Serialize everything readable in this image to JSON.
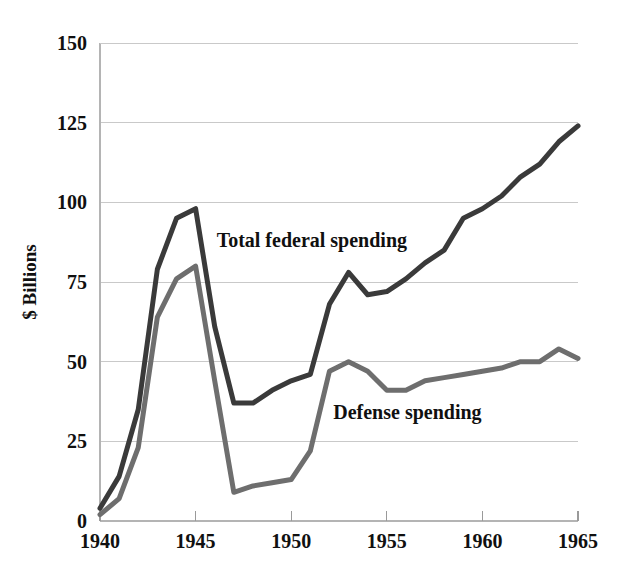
{
  "chart_data": {
    "type": "line",
    "title": "",
    "subtitle": "",
    "xlabel": "",
    "ylabel": "$ Billions",
    "xlim": [
      1940,
      1965
    ],
    "ylim": [
      0,
      150
    ],
    "grid": true,
    "legend": "inline-annotations",
    "x_ticks": [
      1940,
      1945,
      1950,
      1955,
      1960,
      1965
    ],
    "x_tick_labels": [
      "1940",
      "1945",
      "1950",
      "1955",
      "1960",
      "1965"
    ],
    "y_ticks": [
      0,
      25,
      50,
      75,
      100,
      125,
      150
    ],
    "y_tick_labels": [
      "0",
      "25",
      "50",
      "75",
      "100",
      "125",
      "150"
    ],
    "x": [
      1940,
      1941,
      1942,
      1943,
      1944,
      1945,
      1946,
      1947,
      1948,
      1949,
      1950,
      1951,
      1952,
      1953,
      1954,
      1955,
      1956,
      1957,
      1958,
      1959,
      1960,
      1961,
      1962,
      1963,
      1964,
      1965
    ],
    "series": [
      {
        "name": "Total federal spending",
        "color": "#3a3a3a",
        "width": 5.0,
        "label_x": 1946.1,
        "label_y": 86,
        "values": [
          4,
          14,
          35,
          79,
          95,
          98,
          61,
          37,
          37,
          41,
          44,
          46,
          68,
          78,
          71,
          72,
          76,
          81,
          85,
          95,
          98,
          102,
          108,
          112,
          119,
          124
        ]
      },
      {
        "name": "Defense spending",
        "color": "#6e6e6e",
        "width": 5.0,
        "label_x": 1952.2,
        "label_y": 32,
        "values": [
          2,
          7,
          23,
          64,
          76,
          80,
          44,
          9,
          11,
          12,
          13,
          22,
          47,
          50,
          47,
          41,
          41,
          44,
          45,
          46,
          47,
          48,
          50,
          50,
          54,
          51
        ]
      }
    ]
  },
  "plot_geometry": {
    "left": 100,
    "right": 578,
    "top": 43,
    "bottom": 521
  }
}
